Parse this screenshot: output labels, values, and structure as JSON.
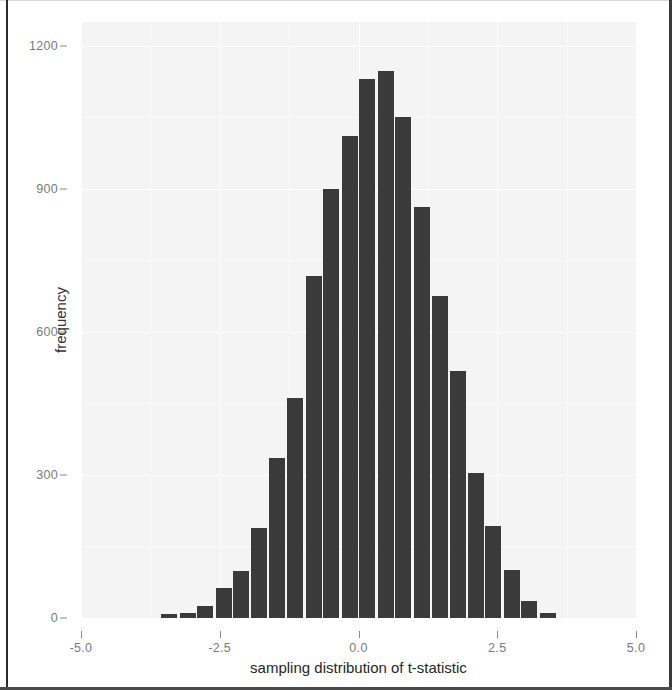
{
  "figure": {
    "background_color": "#ffffff",
    "panel_color": "#f4f4f4",
    "bar_color": "#3a3a3a",
    "gridline_color": "#ffffff",
    "tick_label_color": "#7a7a7a",
    "axis_label_color": "#262626"
  },
  "chart_data": {
    "type": "bar",
    "title": "",
    "subtitle": "",
    "xlabel": "sampling distribution of t-statistic",
    "ylabel": "frequency",
    "xlim": [
      -5.0,
      5.0
    ],
    "ylim": [
      0,
      1250
    ],
    "grid": true,
    "legend": null,
    "x_ticks": [
      -5.0,
      -2.5,
      0.0,
      2.5,
      5.0
    ],
    "x_tick_labels": [
      "-5.0",
      "-2.5",
      "0.0",
      "2.5",
      "5.0"
    ],
    "y_ticks": [
      0,
      300,
      600,
      900,
      1200
    ],
    "y_tick_labels": [
      "0",
      "300",
      "600",
      "900",
      "1200"
    ],
    "bin_width": 0.325,
    "bin_centers": [
      -3.41,
      -3.08,
      -2.76,
      -2.43,
      -2.11,
      -1.79,
      -1.46,
      -1.14,
      -0.81,
      -0.49,
      -0.16,
      0.16,
      0.49,
      0.81,
      1.14,
      1.46,
      1.79,
      2.11,
      2.43,
      2.76,
      3.08,
      3.41
    ],
    "categories": [
      "-3.41",
      "-3.08",
      "-2.76",
      "-2.43",
      "-2.11",
      "-1.79",
      "-1.46",
      "-1.14",
      "-0.81",
      "-0.49",
      "-0.16",
      "0.16",
      "0.49",
      "0.81",
      "1.14",
      "1.46",
      "1.79",
      "2.11",
      "2.43",
      "2.76",
      "3.08",
      "3.41"
    ],
    "values": [
      8,
      10,
      25,
      62,
      98,
      188,
      336,
      462,
      718,
      900,
      1010,
      1130,
      1147,
      1050,
      862,
      676,
      518,
      305,
      192,
      100,
      35,
      10
    ]
  }
}
